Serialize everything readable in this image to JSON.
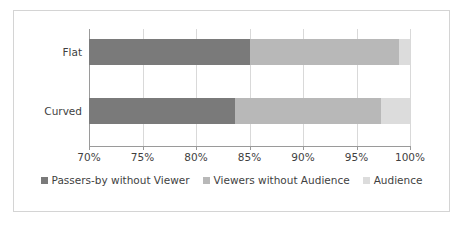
{
  "chart_data": {
    "type": "bar",
    "orientation": "horizontal",
    "stacked": true,
    "title": "",
    "subtitle": "",
    "xlabel": "",
    "ylabel": "",
    "categories": [
      "Flat",
      "Curved"
    ],
    "xlim": [
      70,
      100
    ],
    "xticks": [
      70,
      75,
      80,
      85,
      90,
      95,
      100
    ],
    "xtick_labels": [
      "70%",
      "75%",
      "80%",
      "85%",
      "90%",
      "95%",
      "100%"
    ],
    "grid": true,
    "grid_axis": "x",
    "legend_position": "bottom",
    "value_format": "percent",
    "series": [
      {
        "name": "Passers-by without Viewer",
        "color": "#7a7a7a",
        "values": [
          85.0,
          83.6
        ]
      },
      {
        "name": "Viewers without Audience",
        "color": "#b8b8b8",
        "values": [
          14.0,
          13.7
        ]
      },
      {
        "name": "Audience",
        "color": "#dcdcdc",
        "values": [
          1.0,
          2.7
        ]
      }
    ],
    "cumulative_endpoints": {
      "Flat": [
        85.0,
        99.0,
        100.0
      ],
      "Curved": [
        83.6,
        97.3,
        100.0
      ]
    }
  },
  "axis": {
    "tick_0": "70%",
    "tick_1": "75%",
    "tick_2": "80%",
    "tick_3": "85%",
    "tick_4": "90%",
    "tick_5": "95%",
    "tick_6": "100%"
  },
  "categories": {
    "cat_0": "Flat",
    "cat_1": "Curved"
  },
  "legend": {
    "item_0": "Passers-by without Viewer",
    "item_1": "Viewers without Audience",
    "item_2": "Audience"
  },
  "colors": {
    "series_1": "#7a7a7a",
    "series_2": "#b8b8b8",
    "series_3": "#dcdcdc",
    "gridline": "#d9d9d9",
    "axis": "#9a9a9a",
    "frame_border": "#d4d4d4",
    "background": "#ffffff",
    "text": "#3f3f3f"
  }
}
